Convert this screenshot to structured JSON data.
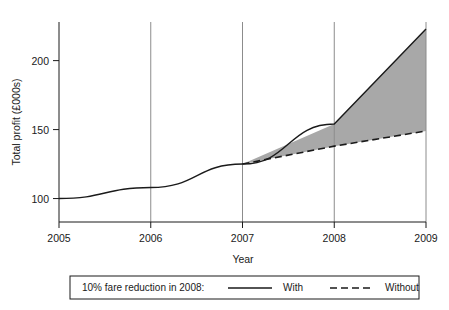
{
  "chart_data": {
    "type": "line",
    "title": "",
    "xlabel": "Year",
    "ylabel": "Total profit (£000s)",
    "x": [
      2005,
      2006,
      2007,
      2008,
      2009
    ],
    "xtick_labels": [
      "2005",
      "2006",
      "2007",
      "2008",
      "2009"
    ],
    "ytick_values": [
      100,
      150,
      200
    ],
    "ytick_labels": [
      "100",
      "150",
      "200"
    ],
    "xlim": [
      2005,
      2009
    ],
    "ylim": [
      83,
      228
    ],
    "grid": "vertical-only",
    "legend_position": "below-axes",
    "series": [
      {
        "name": "With",
        "style": "solid",
        "x": [
          2005,
          2006,
          2007,
          2008,
          2009
        ],
        "values": [
          100,
          108,
          125,
          154,
          223
        ]
      },
      {
        "name": "Without",
        "style": "dashed",
        "x": [
          2007,
          2008,
          2009
        ],
        "values": [
          125,
          138,
          149
        ]
      }
    ],
    "shaded_region": {
      "label": "difference between With and Without",
      "fill_color": "#a8a8a8",
      "from_x": 2007,
      "to_x": 2009
    }
  },
  "legend": {
    "caption": "10% fare reduction in 2008:",
    "entries": [
      {
        "label": "With",
        "style": "solid"
      },
      {
        "label": "Without",
        "style": "dashed"
      }
    ]
  },
  "colors": {
    "line": "#1a1a1a",
    "axis": "#1a1a1a",
    "gridline": "#8c8c8c",
    "shade": "#a8a8a8",
    "background": "#ffffff"
  }
}
